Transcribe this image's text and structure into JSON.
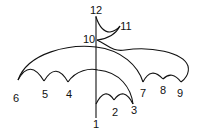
{
  "diagram": {
    "type": "numbered-curve-figure",
    "stroke_color": "#111111",
    "background": "#ffffff",
    "labels": [
      {
        "id": "1",
        "text": "1",
        "x": 96,
        "y": 128
      },
      {
        "id": "2",
        "text": "2",
        "x": 115,
        "y": 116
      },
      {
        "id": "3",
        "text": "3",
        "x": 133,
        "y": 114
      },
      {
        "id": "4",
        "text": "4",
        "x": 69,
        "y": 98
      },
      {
        "id": "5",
        "text": "5",
        "x": 45,
        "y": 98
      },
      {
        "id": "6",
        "text": "6",
        "x": 16,
        "y": 102
      },
      {
        "id": "7",
        "text": "7",
        "x": 143,
        "y": 97
      },
      {
        "id": "8",
        "text": "8",
        "x": 163,
        "y": 94
      },
      {
        "id": "9",
        "text": "9",
        "x": 180,
        "y": 97
      },
      {
        "id": "10",
        "text": "10",
        "x": 89,
        "y": 43
      },
      {
        "id": "11",
        "text": "11",
        "x": 126,
        "y": 30
      },
      {
        "id": "12",
        "text": "12",
        "x": 96,
        "y": 14
      }
    ]
  }
}
